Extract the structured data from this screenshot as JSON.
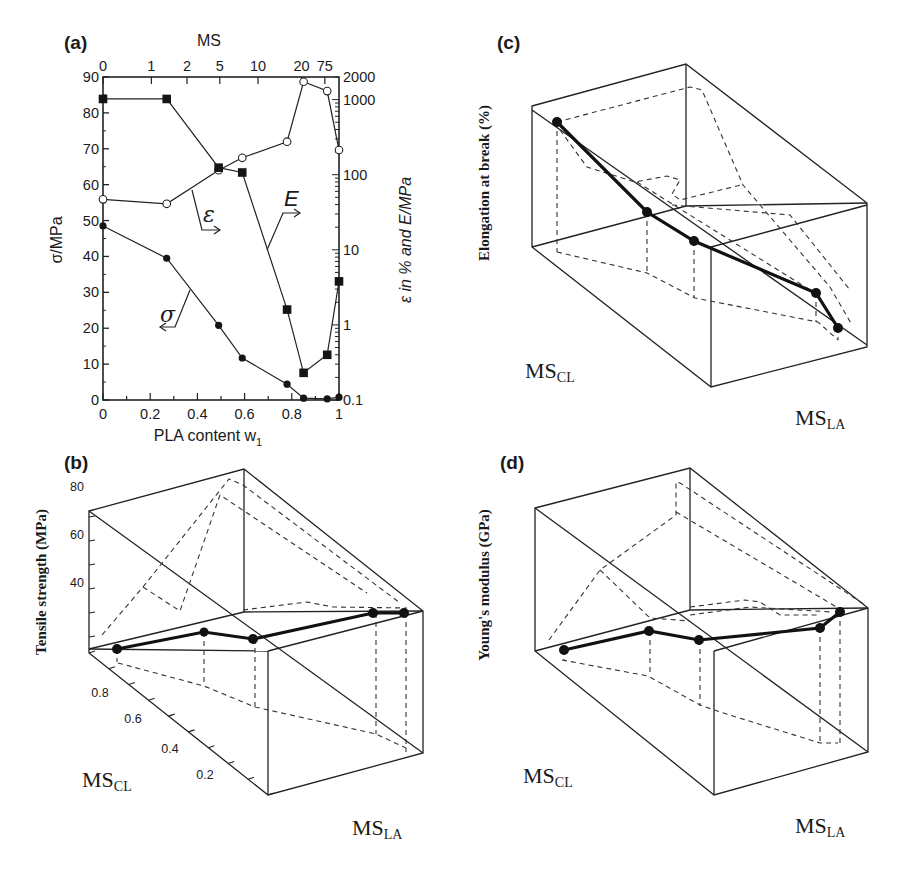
{
  "figure": {
    "panels": [
      "(a)",
      "(b)",
      "(c)",
      "(d)"
    ]
  },
  "chart_data": [
    {
      "id": "a",
      "type": "line",
      "label": "(a)",
      "xlabel": "PLA content w",
      "xlabel_sub": "1",
      "x_ticks": [
        "0",
        "0.2",
        "0.4",
        "0.6",
        "0.8",
        "1"
      ],
      "xlim": [
        0,
        1
      ],
      "top_xlabel": "MS",
      "top_ticks": [
        {
          "label": "0",
          "w": 0.0
        },
        {
          "label": "1",
          "w": 0.205
        },
        {
          "label": "2",
          "w": 0.356
        },
        {
          "label": "5",
          "w": 0.495
        },
        {
          "label": "10",
          "w": 0.657
        },
        {
          "label": "20",
          "w": 0.841
        },
        {
          "label": "75",
          "w": 0.94
        }
      ],
      "ylabel_left": "σ/MPa",
      "ylim_left": [
        0,
        90
      ],
      "y_ticks_left": [
        "0",
        "10",
        "20",
        "30",
        "40",
        "50",
        "60",
        "70",
        "80",
        "90"
      ],
      "ylabel_right": "ε in % and E/MPa",
      "ylim_right_log": [
        0.1,
        2000
      ],
      "y_ticks_right": [
        "0.1",
        "1",
        "10",
        "100",
        "1000",
        "2000"
      ],
      "series": [
        {
          "name": "σ",
          "axis": "left",
          "marker": "filled-circle",
          "x": [
            0,
            0.27,
            0.49,
            0.59,
            0.78,
            0.85,
            0.95,
            1.0
          ],
          "y": [
            48.5,
            39.5,
            20.8,
            11.7,
            4.4,
            0.5,
            0.3,
            0.8
          ]
        },
        {
          "name": "ε",
          "axis": "right",
          "marker": "open-circle",
          "x": [
            0,
            0.27,
            0.49,
            0.59,
            0.78,
            0.85,
            0.95,
            1.0
          ],
          "y": [
            47,
            41,
            115,
            168,
            275,
            1730,
            1300,
            213
          ]
        },
        {
          "name": "E",
          "axis": "right",
          "marker": "filled-square",
          "x": [
            0,
            0.27,
            0.49,
            0.59,
            0.78,
            0.85,
            0.95,
            1.0
          ],
          "y": [
            1020,
            1020,
            124,
            107,
            1.6,
            0.23,
            0.4,
            3.8
          ]
        }
      ],
      "annotations": [
        {
          "text": "σ",
          "arrow": "left"
        },
        {
          "text": "ε",
          "arrow": "right"
        },
        {
          "text": "E",
          "arrow": "right"
        }
      ]
    },
    {
      "id": "b",
      "type": "scatter",
      "label": "(b)",
      "projection": "3d",
      "zlabel": "Tensile strength (MPa)",
      "z_ticks": [
        "40",
        "60",
        "80"
      ],
      "ylabel": "MS",
      "ylabel_sub": "CL",
      "y_ticks": [
        "0",
        "0.2",
        "0.4",
        "0.6",
        "0.8"
      ],
      "xlabel": "MS",
      "xlabel_sub": "LA",
      "x_ticks": [
        "0.1",
        "0.2"
      ],
      "points_approx_z": [
        34,
        38,
        36,
        43,
        42
      ]
    },
    {
      "id": "c",
      "type": "scatter",
      "label": "(c)",
      "projection": "3d",
      "zlabel": "Elongation at break (%)",
      "z_ticks": [
        "20",
        "40",
        "60"
      ],
      "ylabel": "MS",
      "ylabel_sub": "CL",
      "y_ticks": [
        "0",
        "0.2",
        "0.4",
        "0.6",
        "0.8"
      ],
      "xlabel": "MS",
      "xlabel_sub": "LA",
      "x_ticks": [
        "0.1",
        "0.2"
      ],
      "points_approx_z": [
        68,
        30,
        18,
        8,
        3
      ]
    },
    {
      "id": "d",
      "type": "scatter",
      "label": "(d)",
      "projection": "3d",
      "zlabel": "Young's modulus (GPa)",
      "z_ticks": [
        "0.8",
        "1.2",
        "1.6",
        "2"
      ],
      "ylabel": "MS",
      "ylabel_sub": "CL",
      "y_ticks": [
        "0",
        "0.2",
        "0.4",
        "0.6",
        "0.8"
      ],
      "xlabel": "MS",
      "xlabel_sub": "LA",
      "x_ticks": [
        "0.1",
        "0.2"
      ],
      "points_approx_z": [
        0.8,
        0.95,
        0.88,
        0.97,
        1.12
      ]
    }
  ]
}
